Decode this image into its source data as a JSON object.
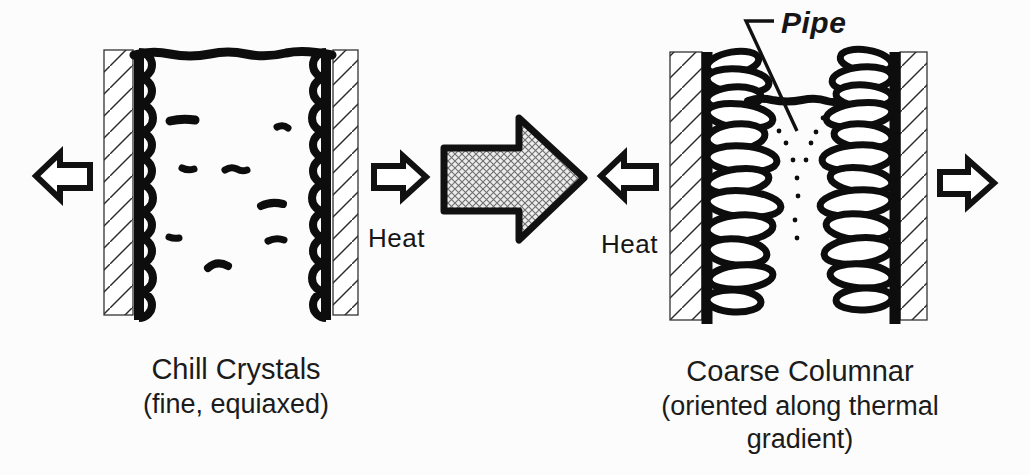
{
  "figure": {
    "title_none": "",
    "left_panel": {
      "caption_title": "Chill Crystals",
      "caption_subtitle": "(fine, equiaxed)",
      "heat_label": "Heat"
    },
    "right_panel": {
      "caption_title": "Coarse Columnar",
      "caption_subtitle": "(oriented along thermal gradient)",
      "heat_label": "Heat",
      "pipe_label": "Pipe"
    },
    "icons": {
      "heat_out_left": "hollow-block-arrow-left",
      "heat_out_right": "hollow-block-arrow-right",
      "progression": "crosshatched-block-arrow-right"
    },
    "colors": {
      "ink": "#0d0d0d",
      "paper": "#fcfcfc",
      "arrow_fill": "#ececec",
      "text": "#1b1b1b"
    }
  }
}
